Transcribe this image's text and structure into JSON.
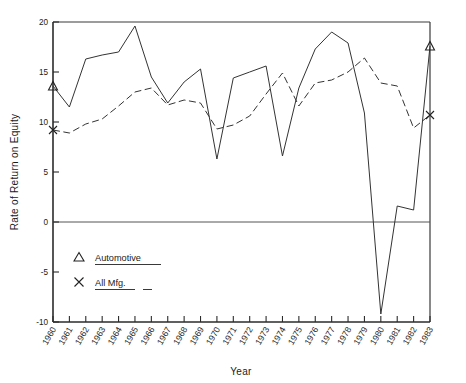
{
  "chart_data": {
    "type": "line",
    "title": "",
    "xlabel": "Year",
    "ylabel": "Rate of Return on Equity",
    "xlim": [
      1960,
      1983
    ],
    "ylim": [
      -10,
      20
    ],
    "yticks": [
      20,
      15,
      10,
      5,
      0,
      -5,
      -10
    ],
    "ytick_labels": [
      "20",
      "15",
      "10",
      "5",
      "0",
      "-5",
      "-10"
    ],
    "grid": false,
    "zero_line": true,
    "legend_position": "lower-left-inside",
    "x": [
      1960,
      1961,
      1962,
      1963,
      1964,
      1965,
      1966,
      1967,
      1968,
      1969,
      1970,
      1971,
      1972,
      1973,
      1974,
      1975,
      1976,
      1977,
      1978,
      1979,
      1980,
      1981,
      1982,
      1983
    ],
    "xtick_labels": [
      "1960",
      "1961",
      "1962",
      "1963",
      "1964",
      "1965",
      "1966",
      "1967",
      "1968",
      "1969",
      "1970",
      "1971",
      "1972",
      "1973",
      "1974",
      "1975",
      "1976",
      "1977",
      "1978",
      "1979",
      "1980",
      "1981",
      "1982",
      "1983"
    ],
    "series": [
      {
        "name": "Automotive",
        "marker": "triangle",
        "linestyle": "solid",
        "color": "#333333",
        "values": [
          13.6,
          11.5,
          16.3,
          16.7,
          17.0,
          19.6,
          14.5,
          11.9,
          14.0,
          15.3,
          6.3,
          14.4,
          15.0,
          15.6,
          6.6,
          13.4,
          17.3,
          19.0,
          17.9,
          10.9,
          -9.2,
          1.6,
          1.2,
          17.6
        ]
      },
      {
        "name": "All Mfg.",
        "marker": "cross",
        "linestyle": "dashed",
        "color": "#333333",
        "values": [
          9.2,
          8.9,
          9.8,
          10.3,
          11.6,
          13.0,
          13.4,
          11.7,
          12.2,
          11.9,
          9.3,
          9.7,
          10.6,
          12.8,
          14.9,
          11.6,
          13.9,
          14.2,
          15.0,
          16.4,
          13.9,
          13.6,
          9.4,
          10.7
        ]
      }
    ],
    "legend": [
      {
        "symbol": "triangle",
        "label": "Automotive",
        "linestyle": "solid"
      },
      {
        "symbol": "cross",
        "label": "All Mfg.",
        "linestyle": "dashed"
      }
    ]
  },
  "axes": {
    "y_title": "Rate of Return on Equity",
    "x_title": "Year"
  }
}
